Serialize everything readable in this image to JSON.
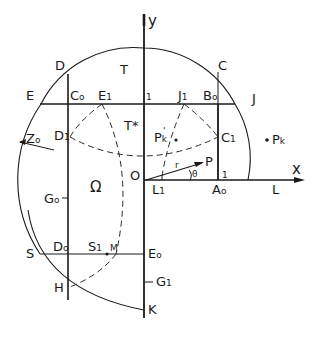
{
  "figure": {
    "background": "#ffffff",
    "ink": "#1a1a1a",
    "axes": {
      "x_label": "x",
      "y_label": "y"
    },
    "labels": {
      "D": "D",
      "T": "T",
      "C": "C",
      "E": "E",
      "C0": "C",
      "C0_sub": "o",
      "E1": "E",
      "E1_sub": "1",
      "one_top": "1",
      "J1": "J",
      "J1_sub": "1",
      "B0": "B",
      "B0_sub": "o",
      "J": "J",
      "Tstar": "T*",
      "D1": "D",
      "D1_sub": "1",
      "Pk_prime": "P",
      "Pk_prime_sub": "k",
      "Pk_prime_mark": "'",
      "C1": "C",
      "C1_sub": "1",
      "Pk": "P",
      "Pk_sub": "k",
      "Z0": "Z",
      "Z0_sub": "o",
      "r": "r",
      "P": "P",
      "O": "O",
      "theta": "θ",
      "one_right": "1",
      "L1": "L",
      "L1_sub": "1",
      "A0": "A",
      "A0_sub": "o",
      "L": "L",
      "Omega": "Ω",
      "Sigma0": "G",
      "Sigma0_sub": "o",
      "S": "S",
      "D0": "D",
      "D0_sub": "o",
      "S1": "S",
      "S1_sub": "1",
      "M": "M",
      "E0": "E",
      "E0_sub": "o",
      "Sigma1": "G",
      "Sigma1_sub": "1",
      "H": "H",
      "K": "K"
    }
  }
}
